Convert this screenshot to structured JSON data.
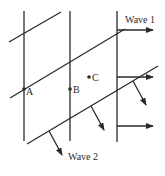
{
  "figure": {
    "type": "wave-fronts-diagram",
    "width": 165,
    "height": 176,
    "stroke_color": "#2a2a2a",
    "background": "#ffffff"
  },
  "waves": [
    {
      "name": "Wave 1",
      "label": "Wave 1",
      "direction": "right",
      "wavefronts": "vertical lines",
      "label_pos": [
        125,
        23
      ]
    },
    {
      "name": "Wave 2",
      "label": "Wave 2",
      "direction": "down-right",
      "wavefronts": "diagonal lines",
      "label_pos": [
        68,
        160
      ]
    }
  ],
  "points": [
    {
      "label": "A",
      "x": 24,
      "y": 89,
      "label_dx": 3,
      "label_dy": 5
    },
    {
      "label": "B",
      "x": 70,
      "y": 89,
      "label_dx": 3,
      "label_dy": 5
    },
    {
      "label": "C",
      "x": 89,
      "y": 77,
      "label_dx": 3,
      "label_dy": 3
    }
  ]
}
